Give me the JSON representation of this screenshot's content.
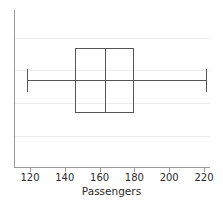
{
  "chart_data": {
    "type": "box",
    "title": "",
    "xlabel": "Passengers",
    "ylabel": "",
    "orientation": "horizontal",
    "xlim": [
      108,
      228
    ],
    "xticks": [
      120,
      140,
      160,
      180,
      200,
      220
    ],
    "xticklabels": [
      "120",
      "140",
      "160",
      "180",
      "200",
      "220"
    ],
    "grid": "horizontal",
    "legend": "none",
    "boxes": [
      {
        "name": "Passengers",
        "whisker_low": 118,
        "q1": 146,
        "median": 163,
        "q3": 180,
        "whisker_high": 221,
        "outliers": []
      }
    ]
  },
  "axis": {
    "xlabel": "Passengers",
    "ticks": [
      {
        "value": 120,
        "label": "120"
      },
      {
        "value": 140,
        "label": "140"
      },
      {
        "value": 160,
        "label": "160"
      },
      {
        "value": 180,
        "label": "180"
      },
      {
        "value": 200,
        "label": "200"
      },
      {
        "value": 220,
        "label": "220"
      }
    ]
  },
  "style": {
    "line_color": "#555555",
    "grid_color": "#ededed",
    "spine_color": "#9a9a9a",
    "text_color": "#2b2b2b",
    "background": "#ffffff"
  }
}
